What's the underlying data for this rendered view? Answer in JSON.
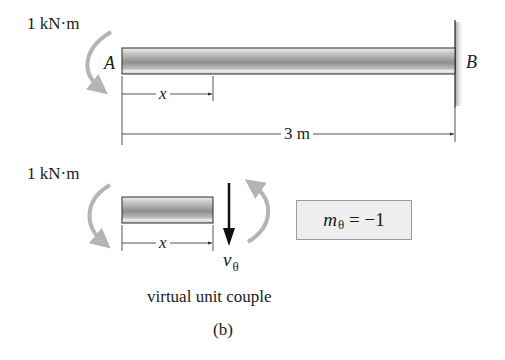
{
  "figure": {
    "label": "(b)",
    "top_diagram": {
      "moment_label": "1 kN·m",
      "point_a": "A",
      "point_b": "B",
      "position_dim": "x",
      "length_dim": "3 m"
    },
    "bottom_diagram": {
      "moment_label": "1 kN·m",
      "position_dim": "x",
      "shear_symbol": "v",
      "shear_subscript": "θ",
      "moment_eq_symbol": "m",
      "moment_eq_subscript": "θ",
      "moment_eq_rhs": " = −1",
      "caption": "virtual unit couple"
    },
    "colors": {
      "beam_dark": "#8c8c8c",
      "beam_light": "#d8d8d8",
      "arrow_gray": "#b4b4b4",
      "box_fill": "#eeeeee",
      "line": "#2a2a2a"
    }
  }
}
